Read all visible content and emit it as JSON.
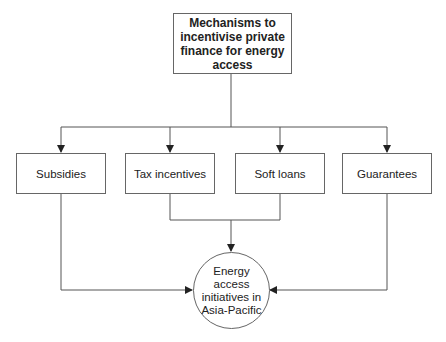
{
  "diagram": {
    "title": "Mechanisms to incentivise private finance for energy access",
    "mechanisms": [
      {
        "label": "Subsidies"
      },
      {
        "label": "Tax incentives"
      },
      {
        "label": "Soft loans"
      },
      {
        "label": "Guarantees"
      }
    ],
    "outcome": "Energy access initiatives in Asia-Pacific",
    "colors": {
      "line": "#555555",
      "border": "#666666",
      "text": "#222222"
    }
  }
}
